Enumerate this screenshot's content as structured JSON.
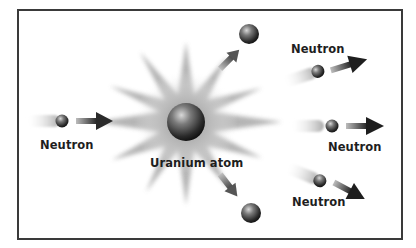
{
  "diagram": {
    "nucleus": {
      "label": "Uranium atom"
    },
    "incoming_neutron": {
      "label": "Neutron"
    },
    "outgoing_neutrons": [
      {
        "label": "Neutron",
        "direction": "up-right"
      },
      {
        "label": "Neutron",
        "direction": "right"
      },
      {
        "label": "Neutron",
        "direction": "down-right"
      }
    ],
    "fragments": [
      {
        "direction": "up"
      },
      {
        "direction": "down"
      }
    ],
    "colors": {
      "frame": "#3a3a3a",
      "ball_dark": "#1a1a1a",
      "ball_light": "#b8b8b8",
      "arrow": "#2a2a2a",
      "text": "#1e1e1e"
    }
  }
}
